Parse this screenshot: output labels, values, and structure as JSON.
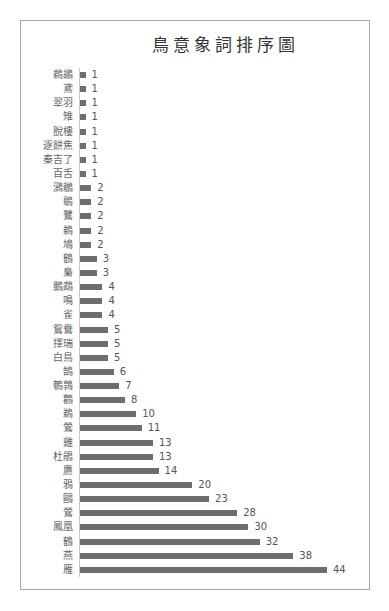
{
  "chart_data": {
    "type": "bar",
    "orientation": "horizontal",
    "title": "鳥意象詞排序圖",
    "xlabel": "",
    "ylabel": "",
    "grid": false,
    "legend": "none",
    "data_labels": true,
    "bar_color": "#6e6e6e",
    "xlim": [
      0,
      44
    ],
    "categories": [
      "鵜鶘",
      "鳶",
      "翠羽",
      "雉",
      "脫樓",
      "逐餅焦",
      "秦吉了",
      "百舌",
      "鸂鶒",
      "鶡",
      "鷺",
      "鵜",
      "鳩",
      "鶴",
      "梟",
      "鵝鵡",
      "鳴",
      "雀",
      "鴛鴦",
      "擇瑞",
      "白鳥",
      "鵠",
      "鵪鶉",
      "鸛",
      "鵜",
      "鶯",
      "雞",
      "杜鵑",
      "鷹",
      "鴉",
      "鷗",
      "鶯",
      "鳳凰",
      "鶴",
      "燕",
      "雁"
    ],
    "values": [
      1,
      1,
      1,
      1,
      1,
      1,
      1,
      1,
      2,
      2,
      2,
      2,
      2,
      3,
      3,
      4,
      4,
      4,
      5,
      5,
      5,
      6,
      7,
      8,
      10,
      11,
      13,
      13,
      14,
      20,
      23,
      28,
      30,
      32,
      38,
      44
    ]
  },
  "rows": [
    {
      "label": "鵜鶘",
      "value": "1",
      "n": 1
    },
    {
      "label": "鳶",
      "value": "1",
      "n": 1
    },
    {
      "label": "翠羽",
      "value": "1",
      "n": 1
    },
    {
      "label": "雉",
      "value": "1",
      "n": 1
    },
    {
      "label": "脫樓",
      "value": "1",
      "n": 1
    },
    {
      "label": "逐餅焦",
      "value": "1",
      "n": 1
    },
    {
      "label": "秦吉了",
      "value": "1",
      "n": 1
    },
    {
      "label": "百舌",
      "value": "1",
      "n": 1
    },
    {
      "label": "鸂鶒",
      "value": "2",
      "n": 2
    },
    {
      "label": "鶡",
      "value": "2",
      "n": 2
    },
    {
      "label": "鷺",
      "value": "2",
      "n": 2
    },
    {
      "label": "鵜",
      "value": "2",
      "n": 2
    },
    {
      "label": "鳩",
      "value": "2",
      "n": 2
    },
    {
      "label": "鶴",
      "value": "3",
      "n": 3
    },
    {
      "label": "梟",
      "value": "3",
      "n": 3
    },
    {
      "label": "鵝鵡",
      "value": "4",
      "n": 4
    },
    {
      "label": "鳴",
      "value": "4",
      "n": 4
    },
    {
      "label": "雀",
      "value": "4",
      "n": 4
    },
    {
      "label": "鴛鴦",
      "value": "5",
      "n": 5
    },
    {
      "label": "擇瑞",
      "value": "5",
      "n": 5
    },
    {
      "label": "白鳥",
      "value": "5",
      "n": 5
    },
    {
      "label": "鵠",
      "value": "6",
      "n": 6
    },
    {
      "label": "鵪鶉",
      "value": "7",
      "n": 7
    },
    {
      "label": "鸛",
      "value": "8",
      "n": 8
    },
    {
      "label": "鵜",
      "value": "10",
      "n": 10
    },
    {
      "label": "鶯",
      "value": "11",
      "n": 11
    },
    {
      "label": "雞",
      "value": "13",
      "n": 13
    },
    {
      "label": "杜鵑",
      "value": "13",
      "n": 13
    },
    {
      "label": "鷹",
      "value": "14",
      "n": 14
    },
    {
      "label": "鴉",
      "value": "20",
      "n": 20
    },
    {
      "label": "鷗",
      "value": "23",
      "n": 23
    },
    {
      "label": "鶯",
      "value": "28",
      "n": 28
    },
    {
      "label": "鳳凰",
      "value": "30",
      "n": 30
    },
    {
      "label": "鶴",
      "value": "32",
      "n": 32
    },
    {
      "label": "燕",
      "value": "38",
      "n": 38
    },
    {
      "label": "雁",
      "value": "44",
      "n": 44
    }
  ]
}
